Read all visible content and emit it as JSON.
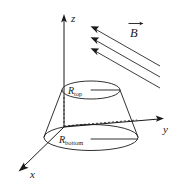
{
  "figure": {
    "background_color": "#ffffff",
    "ink_color": "#1a1a1a"
  },
  "axes": {
    "z_label": "z",
    "y_label": "y",
    "x_label": "x",
    "origin": {
      "x": 64,
      "y": 127
    },
    "z_tip": {
      "x": 64,
      "y": 16
    },
    "y_tip": {
      "x": 163,
      "y": 119
    },
    "x_tip": {
      "x": 19,
      "y": 170
    }
  },
  "solid": {
    "top_radius_label": "R",
    "top_radius_subscript": "top",
    "bottom_radius_label": "R",
    "bottom_radius_subscript": "bottom",
    "top_ellipse": {
      "cx": 91,
      "cy": 90,
      "rx": 29,
      "ry": 9
    },
    "bottom_ellipse": {
      "cx": 91,
      "cy": 138,
      "rx": 47,
      "ry": 13
    }
  },
  "field": {
    "label": "B",
    "vector_notation": "arrow-over",
    "arrow_count": 3,
    "direction": "up-left",
    "lines": [
      {
        "x1": 160,
        "y1": 66,
        "x2": 92,
        "y2": 27
      },
      {
        "x1": 160,
        "y1": 76,
        "x2": 92,
        "y2": 37
      },
      {
        "x1": 160,
        "y1": 86,
        "x2": 92,
        "y2": 47
      }
    ],
    "label_pos": {
      "x": 134,
      "y": 33
    }
  }
}
